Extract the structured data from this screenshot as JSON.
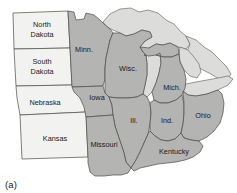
{
  "figure": {
    "caption": "(a)",
    "type": "choropleth-region-map",
    "colors": {
      "unshaded_state_fill": "#f2f2f0",
      "shaded_state_fill": "#b4b4b2",
      "water_fill": "#dcdcda",
      "outline": "#4a4a4a",
      "background": "#ffffff",
      "label_text": "#1b1b1b"
    }
  },
  "map": {
    "unshaded_states": [
      {
        "id": "north-dakota",
        "label_line1": "North",
        "label_line2": "Dakota",
        "cx": 42,
        "cy": 29
      },
      {
        "id": "south-dakota",
        "label_line1": "South",
        "label_line2": "Dakota",
        "cx": 42,
        "cy": 66
      },
      {
        "id": "nebraska",
        "label_line1": "Nebraska",
        "label_line2": "",
        "cx": 45,
        "cy": 103
      },
      {
        "id": "kansas",
        "label_line1": "Kansas",
        "label_line2": "",
        "cx": 55,
        "cy": 139
      }
    ],
    "shaded_states": [
      {
        "id": "minnesota",
        "label": "Minn.",
        "cx": 84,
        "cy": 50
      },
      {
        "id": "wisconsin",
        "label": "Wisc.",
        "cx": 128,
        "cy": 69
      },
      {
        "id": "michigan",
        "label": "Mich.",
        "cx": 172,
        "cy": 88
      },
      {
        "id": "iowa",
        "label": "Iowa",
        "cx": 97,
        "cy": 98
      },
      {
        "id": "illinois",
        "label": "Ill.",
        "cx": 134,
        "cy": 119
      },
      {
        "id": "indiana",
        "label": "Ind.",
        "cx": 168,
        "cy": 120
      },
      {
        "id": "ohio",
        "label": "Ohio",
        "cx": 203,
        "cy": 116
      },
      {
        "id": "missouri",
        "label": "Missouri",
        "cx": 105,
        "cy": 145
      },
      {
        "id": "kentucky",
        "label": "Kentucky",
        "cx": 174,
        "cy": 152
      }
    ],
    "water_bodies": [
      {
        "id": "lake-superior"
      },
      {
        "id": "lake-michigan"
      },
      {
        "id": "lake-huron"
      },
      {
        "id": "lake-erie"
      }
    ]
  }
}
